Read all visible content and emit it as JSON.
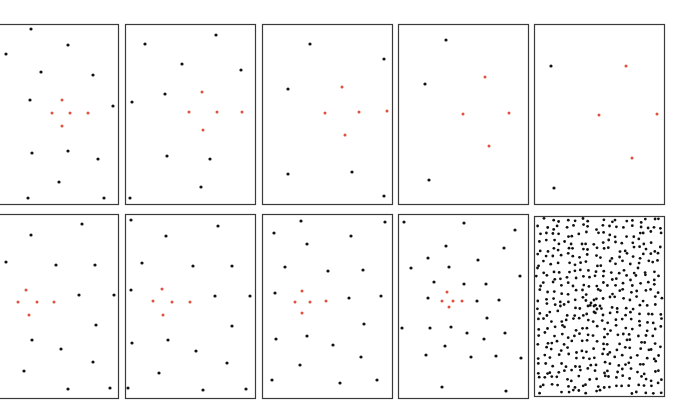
{
  "figure": {
    "colors": {
      "background": "#ffffff",
      "frame": "#3a3a3a",
      "black_dot": "#111111",
      "red_dot": "#e0503c"
    },
    "panels": [
      {
        "id": "top-1",
        "box": [
          -2,
          24,
          120,
          180
        ],
        "black": [
          [
            31,
            29
          ],
          [
            68,
            45
          ],
          [
            6,
            54
          ],
          [
            41,
            72
          ],
          [
            93,
            75
          ],
          [
            30,
            100
          ],
          [
            113,
            106
          ],
          [
            32,
            153
          ],
          [
            68,
            151
          ],
          [
            98,
            159
          ],
          [
            59,
            182
          ],
          [
            28,
            198
          ],
          [
            104,
            198
          ]
        ],
        "red": [
          [
            62,
            100
          ],
          [
            52,
            113
          ],
          [
            70,
            113
          ],
          [
            88,
            113
          ],
          [
            62,
            126
          ]
        ]
      },
      {
        "id": "top-2",
        "box": [
          125,
          24,
          130,
          180
        ],
        "black": [
          [
            145,
            44
          ],
          [
            216,
            35
          ],
          [
            182,
            64
          ],
          [
            241,
            70
          ],
          [
            165,
            94
          ],
          [
            132,
            102
          ],
          [
            167,
            156
          ],
          [
            210,
            159
          ],
          [
            201,
            187
          ],
          [
            130,
            198
          ]
        ],
        "red": [
          [
            202,
            92
          ],
          [
            189,
            112
          ],
          [
            217,
            112
          ],
          [
            242,
            112
          ],
          [
            203,
            130
          ]
        ]
      },
      {
        "id": "top-3",
        "box": [
          262,
          24,
          130,
          180
        ],
        "black": [
          [
            310,
            44
          ],
          [
            384,
            59
          ],
          [
            288,
            89
          ],
          [
            288,
            174
          ],
          [
            352,
            172
          ],
          [
            384,
            196
          ]
        ],
        "red": [
          [
            342,
            87
          ],
          [
            325,
            113
          ],
          [
            359,
            112
          ],
          [
            387,
            111
          ],
          [
            345,
            135
          ]
        ]
      },
      {
        "id": "top-4",
        "box": [
          398,
          24,
          130,
          180
        ],
        "black": [
          [
            446,
            40
          ],
          [
            425,
            84
          ],
          [
            429,
            180
          ]
        ],
        "red": [
          [
            485,
            77
          ],
          [
            463,
            114
          ],
          [
            509,
            113
          ],
          [
            489,
            146
          ]
        ]
      },
      {
        "id": "top-5",
        "box": [
          534,
          24,
          130,
          180
        ],
        "black": [
          [
            551,
            66
          ],
          [
            554,
            188
          ]
        ],
        "red": [
          [
            626,
            66
          ],
          [
            599,
            115
          ],
          [
            657,
            114
          ],
          [
            632,
            158
          ]
        ]
      },
      {
        "id": "bottom-1",
        "box": [
          -2,
          214,
          120,
          184
        ],
        "black": [
          [
            82,
            224
          ],
          [
            31,
            235
          ],
          [
            6,
            262
          ],
          [
            56,
            265
          ],
          [
            95,
            265
          ],
          [
            79,
            295
          ],
          [
            114,
            295
          ],
          [
            96,
            325
          ],
          [
            32,
            340
          ],
          [
            61,
            349
          ],
          [
            93,
            362
          ],
          [
            24,
            371
          ],
          [
            68,
            389
          ],
          [
            110,
            388
          ]
        ],
        "red": [
          [
            26,
            290
          ],
          [
            18,
            302
          ],
          [
            37,
            302
          ],
          [
            54,
            302
          ],
          [
            29,
            315
          ]
        ]
      },
      {
        "id": "bottom-2",
        "box": [
          125,
          214,
          130,
          184
        ],
        "black": [
          [
            131,
            220
          ],
          [
            218,
            226
          ],
          [
            166,
            236
          ],
          [
            142,
            263
          ],
          [
            193,
            266
          ],
          [
            232,
            266
          ],
          [
            131,
            290
          ],
          [
            215,
            296
          ],
          [
            250,
            296
          ],
          [
            232,
            326
          ],
          [
            132,
            343
          ],
          [
            168,
            340
          ],
          [
            196,
            351
          ],
          [
            227,
            363
          ],
          [
            159,
            373
          ],
          [
            128,
            388
          ],
          [
            203,
            390
          ],
          [
            246,
            389
          ]
        ],
        "red": [
          [
            162,
            289
          ],
          [
            153,
            301
          ],
          [
            172,
            302
          ],
          [
            190,
            302
          ],
          [
            163,
            315
          ]
        ]
      },
      {
        "id": "bottom-3",
        "box": [
          262,
          214,
          130,
          184
        ],
        "black": [
          [
            301,
            221
          ],
          [
            385,
            222
          ],
          [
            274,
            233
          ],
          [
            307,
            244
          ],
          [
            351,
            236
          ],
          [
            285,
            267
          ],
          [
            328,
            271
          ],
          [
            363,
            270
          ],
          [
            275,
            293
          ],
          [
            349,
            298
          ],
          [
            381,
            296
          ],
          [
            364,
            324
          ],
          [
            276,
            339
          ],
          [
            307,
            336
          ],
          [
            333,
            345
          ],
          [
            361,
            357
          ],
          [
            300,
            365
          ],
          [
            272,
            380
          ],
          [
            340,
            383
          ],
          [
            377,
            380
          ]
        ],
        "red": [
          [
            302,
            291
          ],
          [
            295,
            302
          ],
          [
            310,
            302
          ],
          [
            326,
            301
          ],
          [
            302,
            313
          ]
        ]
      },
      {
        "id": "bottom-4",
        "box": [
          398,
          214,
          130,
          184
        ],
        "black": [
          [
            404,
            222
          ],
          [
            464,
            223
          ],
          [
            515,
            230
          ],
          [
            446,
            246
          ],
          [
            504,
            248
          ],
          [
            428,
            258
          ],
          [
            478,
            260
          ],
          [
            411,
            268
          ],
          [
            449,
            267
          ],
          [
            520,
            276
          ],
          [
            434,
            282
          ],
          [
            464,
            284
          ],
          [
            486,
            284
          ],
          [
            428,
            298
          ],
          [
            477,
            301
          ],
          [
            499,
            300
          ],
          [
            487,
            318
          ],
          [
            402,
            328
          ],
          [
            430,
            328
          ],
          [
            451,
            327
          ],
          [
            467,
            333
          ],
          [
            484,
            339
          ],
          [
            505,
            333
          ],
          [
            445,
            346
          ],
          [
            426,
            355
          ],
          [
            471,
            357
          ],
          [
            496,
            356
          ],
          [
            521,
            358
          ],
          [
            442,
            387
          ],
          [
            506,
            391
          ]
        ],
        "red": [
          [
            447,
            292
          ],
          [
            442,
            301
          ],
          [
            453,
            301
          ],
          [
            462,
            301
          ],
          [
            449,
            307
          ]
        ]
      }
    ],
    "dense_panel": {
      "id": "bottom-5",
      "box": [
        534,
        216,
        130,
        180
      ],
      "dot_spacing": 7.2,
      "seed": 7,
      "center": [
        594,
        306
      ]
    }
  }
}
